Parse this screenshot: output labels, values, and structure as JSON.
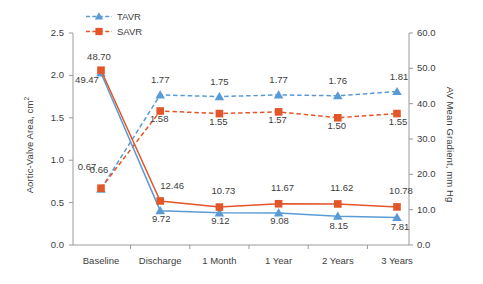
{
  "chart_data": {
    "type": "line",
    "title": "",
    "categories": [
      "Baseline",
      "Discharge",
      "1 Month",
      "1 Year",
      "2 Years",
      "3 Years"
    ],
    "xlabel": "",
    "y_left": {
      "label": "Aortic-Valve Area, cm2",
      "label_main": "Aortic-Valve Area, cm",
      "label_sup": "2",
      "ticks": [
        "0.0",
        "0.5",
        "1.0",
        "1.5",
        "2.0",
        "2.5"
      ],
      "ylim": [
        0.0,
        2.5
      ]
    },
    "y_right": {
      "label": "AV Mean Gradient, mm Hg",
      "ticks": [
        "0.0",
        "10.0",
        "20.0",
        "30.0",
        "40.0",
        "50.0",
        "60.0"
      ],
      "ylim": [
        0.0,
        60.0
      ]
    },
    "grid": false,
    "legend_position": "top-left",
    "legend": [
      {
        "name": "TAVR",
        "marker": "triangle",
        "color": "#5b9bd5"
      },
      {
        "name": "SAVR",
        "marker": "square",
        "color": "#e2562a"
      }
    ],
    "series": [
      {
        "name": "TAVR Aortic-Valve Area",
        "group": "TAVR",
        "axis": "left",
        "linestyle": "dashed",
        "color": "#5b9bd5",
        "marker": "triangle",
        "values": [
          0.66,
          1.77,
          1.75,
          1.77,
          1.76,
          1.81
        ],
        "labels": [
          "0.66",
          "1.77",
          "1.75",
          "1.77",
          "1.76",
          "1.81"
        ]
      },
      {
        "name": "SAVR Aortic-Valve Area",
        "group": "SAVR",
        "axis": "left",
        "linestyle": "dashed",
        "color": "#e2562a",
        "marker": "square",
        "values": [
          0.67,
          1.58,
          1.55,
          1.57,
          1.5,
          1.55
        ],
        "labels": [
          "0.67",
          "1.58",
          "1.55",
          "1.57",
          "1.50",
          "1.55"
        ]
      },
      {
        "name": "TAVR AV Mean Gradient",
        "group": "TAVR",
        "axis": "right",
        "linestyle": "solid",
        "color": "#5b9bd5",
        "marker": "triangle",
        "values": [
          48.7,
          9.72,
          9.12,
          9.08,
          8.15,
          7.81
        ],
        "labels": [
          "48.70",
          "9.72",
          "9.12",
          "9.08",
          "8.15",
          "7.81"
        ]
      },
      {
        "name": "SAVR AV Mean Gradient",
        "group": "SAVR",
        "axis": "right",
        "linestyle": "solid",
        "color": "#e2562a",
        "marker": "square",
        "values": [
          49.47,
          12.46,
          10.73,
          11.67,
          11.62,
          10.78
        ],
        "labels": [
          "49.47",
          "12.46",
          "10.73",
          "11.67",
          "11.62",
          "10.78"
        ]
      }
    ]
  },
  "colors": {
    "tavr": "#5b9bd5",
    "savr": "#e2562a",
    "axis": "#9a9a9a",
    "text": "#3d3d3d",
    "background": "#ffffff"
  }
}
